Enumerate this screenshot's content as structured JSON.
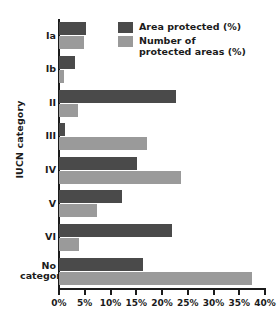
{
  "chart_data": {
    "type": "bar",
    "orientation": "horizontal",
    "title": "",
    "xlabel": "",
    "ylabel": "IUCN category",
    "xlim": [
      0,
      40
    ],
    "xunit": "%",
    "grid": false,
    "legend_position": "top-right",
    "categories": [
      "Ia",
      "Ib",
      "II",
      "III",
      "IV",
      "V",
      "VI",
      "No\ncategory"
    ],
    "xticks": [
      "0%",
      "5%",
      "10%",
      "15%",
      "20%",
      "25%",
      "30%",
      "35%",
      "40%"
    ],
    "xtick_values": [
      0,
      5,
      10,
      15,
      20,
      25,
      30,
      35,
      40
    ],
    "series": [
      {
        "name": "Area protected (%)",
        "color": "#4a4a4a",
        "values": [
          5.3,
          3.2,
          22.7,
          1.2,
          15.2,
          12.3,
          22.0,
          16.4
        ]
      },
      {
        "name": "Number of\nprotected areas (%)",
        "color": "#9a9a9a",
        "values": [
          4.9,
          1.0,
          3.7,
          17.1,
          23.6,
          7.4,
          3.9,
          37.5
        ]
      }
    ]
  },
  "legend": {
    "items": [
      {
        "label": "Area protected (%)",
        "color": "#4a4a4a"
      },
      {
        "label": "Number of\nprotected areas (%)",
        "color": "#9a9a9a"
      }
    ]
  },
  "axes": {
    "y_title": "IUCN category"
  },
  "colors": {
    "dark": "#4a4a4a",
    "light": "#9a9a9a",
    "axis": "#1b1b1b",
    "background": "#ffffff"
  }
}
